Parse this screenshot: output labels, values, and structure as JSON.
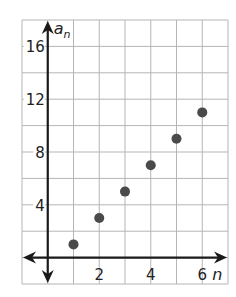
{
  "chart_data": {
    "type": "scatter",
    "title": "",
    "xlabel": "n",
    "ylabel": "a_n",
    "ylabel_main": "a",
    "ylabel_sub": "n",
    "x": [
      1,
      2,
      3,
      4,
      5,
      6
    ],
    "series": [
      {
        "name": "a_n",
        "values": [
          1,
          3,
          5,
          7,
          9,
          11
        ],
        "color": "#4a4a4a"
      }
    ],
    "xlim": [
      -1,
      7
    ],
    "ylim": [
      -2,
      18
    ],
    "x_ticks": [
      2,
      4,
      6
    ],
    "y_ticks": [
      4,
      8,
      12,
      16
    ],
    "x_tick_labels": [
      "2",
      "4",
      "6"
    ],
    "y_tick_labels": [
      "4",
      "8",
      "12",
      "16"
    ],
    "grid": true,
    "grid_step_x": 1,
    "grid_step_y": 2,
    "legend": "none",
    "colors": {
      "grid": "#b5b5b5",
      "axis": "#1a1a1a",
      "point": "#4a4a4a"
    }
  }
}
